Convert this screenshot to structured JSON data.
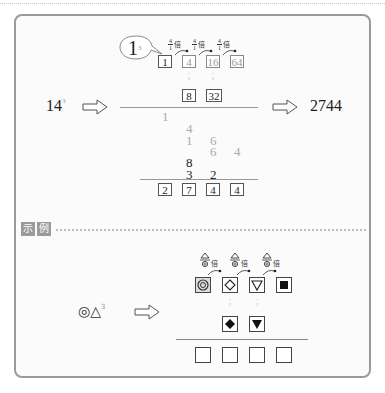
{
  "example_1": {
    "base": "14",
    "exponent": "3",
    "result": "2744",
    "hint_base": "1",
    "hint_exponent": "3",
    "multiplier": {
      "numerator": "4",
      "denominator": "1",
      "suffix": "倍"
    },
    "top_row": [
      "1",
      "4",
      "16",
      "64"
    ],
    "doubling_note": "×2",
    "mid_row": [
      "8",
      "32"
    ],
    "partials": {
      "row1": [
        "1"
      ],
      "row2": [
        "4"
      ],
      "row3": [
        "1",
        "6"
      ],
      "row4": [
        "6",
        "4"
      ],
      "row5": [
        "8"
      ],
      "row6": [
        "3",
        "2"
      ]
    },
    "answer_boxes": [
      "2",
      "7",
      "4",
      "4"
    ]
  },
  "example_label": [
    "示",
    "例"
  ],
  "example_2": {
    "base_symbols": [
      "◎",
      "△"
    ],
    "exponent": "3",
    "multiplier": {
      "numerator": "△",
      "denominator": "◎",
      "suffix": "倍"
    },
    "top_row": [
      "◎",
      "◇",
      "▽",
      "■"
    ],
    "mid_row": [
      "◆",
      "▼"
    ],
    "answer_boxes": [
      "",
      "",
      "",
      ""
    ]
  },
  "icons": {
    "arrow": "right-outline-arrow",
    "curve_arrow": "curved-arrow"
  }
}
